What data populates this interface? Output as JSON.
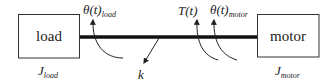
{
  "diagram": {
    "type": "two-mass torsional system",
    "load_box": {
      "label": "load"
    },
    "motor_box": {
      "label": "motor"
    },
    "labels": {
      "theta_load": {
        "main": "θ(t)",
        "sub": "load"
      },
      "torque": {
        "main": "T(t)"
      },
      "theta_motor": {
        "main": "θ(t)",
        "sub": "motor"
      },
      "stiffness": {
        "main": "k"
      },
      "inertia_load": {
        "main": "J",
        "sub": "load"
      },
      "inertia_motor": {
        "main": "J",
        "sub": "motor"
      }
    },
    "colors": {
      "line": "#222222",
      "shaft": "#111111",
      "background": "#ffffff"
    }
  }
}
